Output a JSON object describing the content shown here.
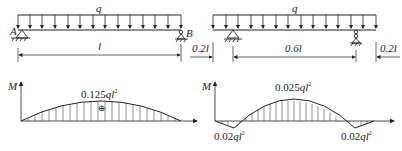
{
  "diagram_a": {
    "load_label": "q",
    "support_left": "A",
    "support_right": "B",
    "span_label": "l",
    "moment_axis": "M",
    "max_moment": {
      "coef": "0.125",
      "var": "ql",
      "exp": "2"
    },
    "sign": "⊕"
  },
  "diagram_b": {
    "load_label": "q",
    "dims": [
      "0.2l",
      "0.6l",
      "0.2l"
    ],
    "moment_axis": "M",
    "mid_moment": {
      "coef": "0.025",
      "var": "ql",
      "exp": "2"
    },
    "left_support_moment": {
      "coef": "0.02",
      "var": "ql",
      "exp": "2"
    },
    "right_support_moment": {
      "coef": "0.02",
      "var": "ql",
      "exp": "2"
    }
  }
}
